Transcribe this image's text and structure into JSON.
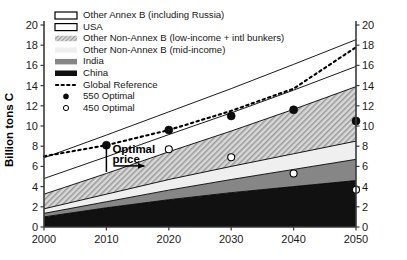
{
  "chart_data": {
    "type": "area",
    "title": "",
    "xlabel": "",
    "ylabel": "Billion tons C",
    "x": [
      2000,
      2010,
      2020,
      2030,
      2040,
      2050
    ],
    "xlim": [
      2000,
      2050
    ],
    "ylim": [
      0,
      20
    ],
    "xticks": [
      "2000",
      "2010",
      "2020",
      "2030",
      "2040",
      "2050"
    ],
    "yticks": [
      "0",
      "2",
      "4",
      "6",
      "8",
      "10",
      "12",
      "14",
      "16",
      "18",
      "20"
    ],
    "yticks_right": [
      "0",
      "2",
      "4",
      "6",
      "8",
      "10",
      "12",
      "14",
      "16",
      "18",
      "20"
    ],
    "grid": false,
    "legend_position": "top-left",
    "stacked": true,
    "series": [
      {
        "name": "China",
        "fill": "black",
        "color": "#111111",
        "values": [
          1.0,
          1.9,
          2.7,
          3.4,
          4.0,
          4.6
        ]
      },
      {
        "name": "India",
        "fill": "dark-gray",
        "color": "#808080",
        "values": [
          0.35,
          0.6,
          0.95,
          1.3,
          1.7,
          2.1
        ]
      },
      {
        "name": "Other Non-Annex B (mid-income)",
        "fill": "very-light-gray",
        "color": "#ececec",
        "values": [
          0.45,
          0.75,
          1.05,
          1.3,
          1.55,
          1.8
        ]
      },
      {
        "name": "Other Non-Annex B (low-income + intl bunkers)",
        "fill": "hatch-gray",
        "color": "#c9c9c9",
        "values": [
          1.45,
          2.05,
          2.75,
          3.5,
          4.4,
          5.4
        ]
      },
      {
        "name": "USA",
        "fill": "white",
        "color": "#ffffff",
        "values": [
          1.55,
          1.65,
          1.7,
          1.8,
          1.9,
          2.0
        ]
      },
      {
        "name": "Other Annex B (including Russia)",
        "fill": "white",
        "color": "#ffffff",
        "values": [
          2.05,
          2.15,
          2.25,
          2.4,
          2.55,
          2.65
        ]
      }
    ],
    "reference_line": {
      "name": "Global Reference",
      "style": "dotted",
      "values": [
        7.0,
        8.1,
        9.6,
        11.5,
        13.7,
        17.8
      ]
    },
    "markers": [
      {
        "name": "550 Optimal",
        "style": "filled-circle",
        "x": [
          2010,
          2020,
          2030,
          2040,
          2050
        ],
        "y": [
          8.1,
          9.6,
          11.0,
          11.6,
          10.5
        ]
      },
      {
        "name": "450 Optimal",
        "style": "open-circle",
        "x": [
          2020,
          2030,
          2040,
          2050
        ],
        "y": [
          7.7,
          6.9,
          5.3,
          3.7
        ]
      }
    ],
    "annotations": [
      {
        "name": "optimal-price",
        "text_line1": "Optimal",
        "text_line2": "price",
        "x": 2010,
        "has_vertical_bracket": true,
        "has_arrow": true
      }
    ]
  },
  "legend": {
    "items": [
      {
        "label": "Other Annex B (including Russia)",
        "swatch": "box-white"
      },
      {
        "label": "USA",
        "swatch": "box-white"
      },
      {
        "label": "Other Non-Annex B (low-income + intl bunkers)",
        "swatch": "hatch-gray"
      },
      {
        "label": "Other Non-Annex B (mid-income)",
        "swatch": "very-light-gray"
      },
      {
        "label": "India",
        "swatch": "dark-gray"
      },
      {
        "label": "China",
        "swatch": "black"
      },
      {
        "label": "Global Reference",
        "swatch": "dotted-line"
      },
      {
        "label": "550 Optimal",
        "swatch": "filled-circle"
      },
      {
        "label": "450 Optimal",
        "swatch": "open-circle"
      }
    ]
  },
  "axes": {
    "y_title": "Billion tons C"
  }
}
